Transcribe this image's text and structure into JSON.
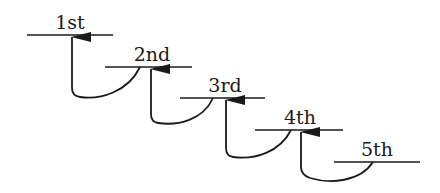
{
  "diagram": {
    "stroke_color": "#1a1a1a",
    "steps": [
      {
        "label": "1st",
        "x1": 27,
        "x2": 113,
        "y": 35,
        "label_x": 70
      },
      {
        "label": "2nd",
        "x1": 105,
        "x2": 192,
        "y": 67,
        "label_x": 152
      },
      {
        "label": "3rd",
        "x1": 180,
        "x2": 265,
        "y": 98,
        "label_x": 225
      },
      {
        "label": "4th",
        "x1": 255,
        "x2": 343,
        "y": 130,
        "label_x": 300
      },
      {
        "label": "5th",
        "x1": 334,
        "x2": 420,
        "y": 162,
        "label_x": 377
      }
    ],
    "arrows": [
      {
        "from": "2nd",
        "to": "1st"
      },
      {
        "from": "3rd",
        "to": "2nd"
      },
      {
        "from": "4th",
        "to": "3rd"
      },
      {
        "from": "5th",
        "to": "4th"
      }
    ]
  }
}
